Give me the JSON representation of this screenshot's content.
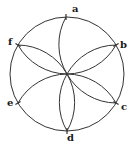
{
  "diagram": {
    "title": "",
    "stroke_color": "#333333",
    "center": {
      "x": 67,
      "y": 74
    },
    "radius": 57,
    "points": [
      {
        "id": "a",
        "label": "a",
        "x": 66,
        "y": 17,
        "label_x": 72,
        "label_y": 4
      },
      {
        "id": "b",
        "label": "b",
        "x": 116,
        "y": 45,
        "label_x": 120,
        "label_y": 40
      },
      {
        "id": "c",
        "label": "c",
        "x": 116,
        "y": 103,
        "label_x": 121,
        "label_y": 102
      },
      {
        "id": "d",
        "label": "d",
        "x": 67,
        "y": 131,
        "label_x": 67,
        "label_y": 133
      },
      {
        "id": "e",
        "label": "e",
        "x": 18,
        "y": 103,
        "label_x": 7,
        "label_y": 98
      },
      {
        "id": "f",
        "label": "f",
        "x": 18,
        "y": 45,
        "label_x": 8,
        "label_y": 37
      }
    ],
    "arcs": [
      {
        "to": "a",
        "sweep": 1
      },
      {
        "to": "b",
        "sweep": 0
      },
      {
        "to": "b",
        "sweep": 1
      },
      {
        "to": "c",
        "sweep": 0
      },
      {
        "to": "c",
        "sweep": 1
      },
      {
        "to": "d",
        "sweep": 0
      },
      {
        "to": "d",
        "sweep": 1
      },
      {
        "to": "e",
        "sweep": 0
      },
      {
        "to": "f",
        "sweep": 0
      },
      {
        "to": "f",
        "sweep": 1
      }
    ]
  }
}
